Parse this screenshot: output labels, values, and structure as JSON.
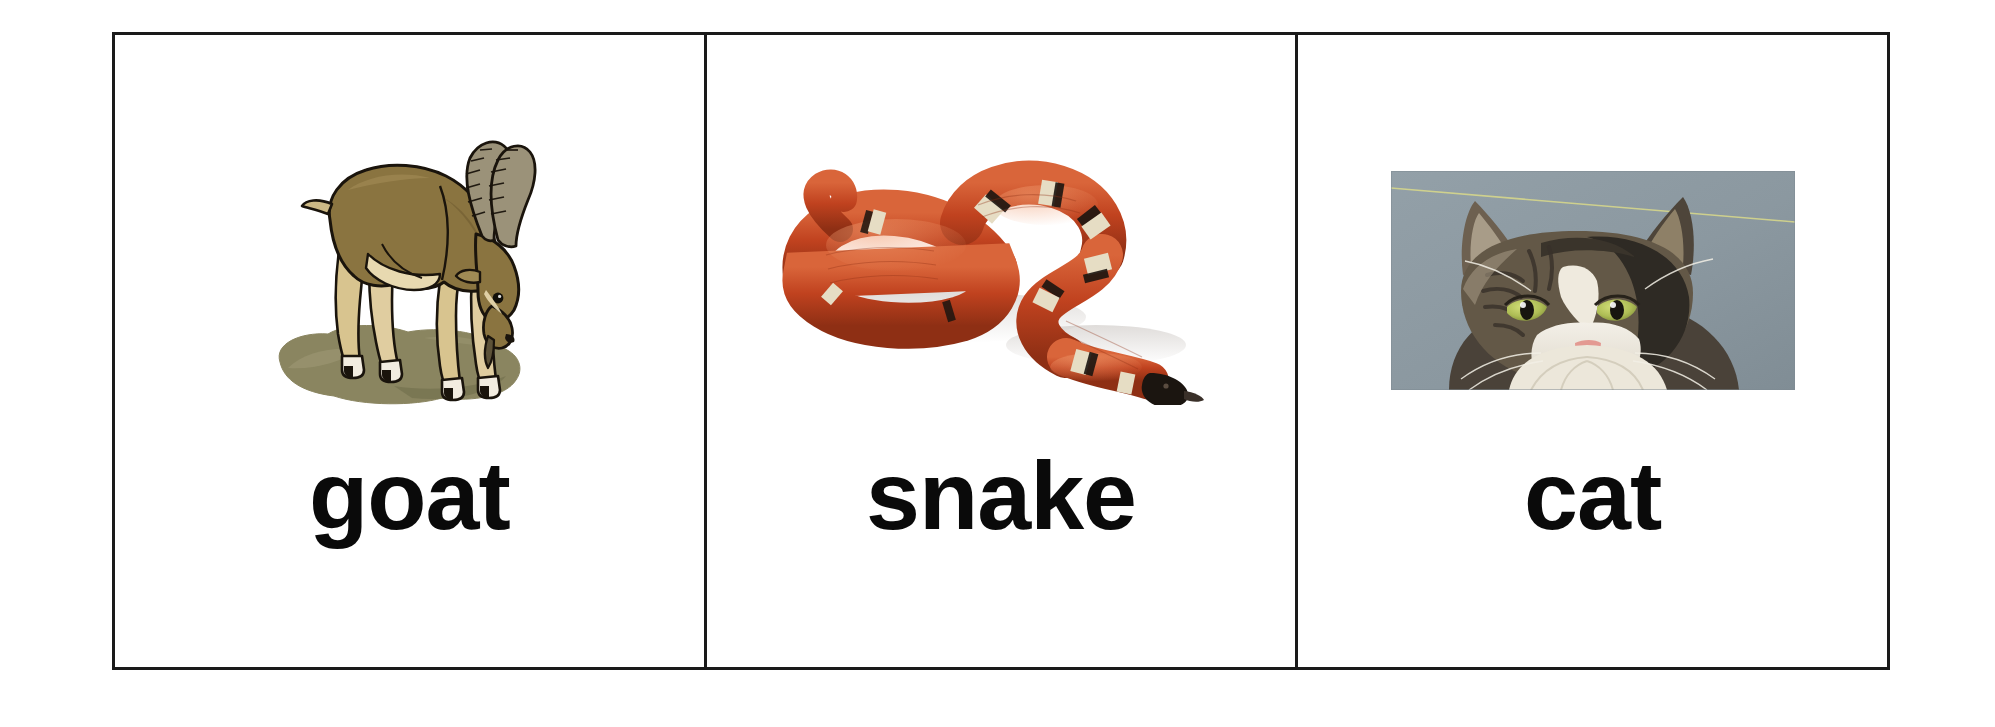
{
  "sheet": {
    "background_color": "#ffffff",
    "border_color": "#1a1a1a",
    "width": 1995,
    "height": 727
  },
  "cards": [
    {
      "id": "goat",
      "label": "goat",
      "art_name": "goat-illustration",
      "art_type": "line-art-illustration",
      "art_description": "Brown ibex-like goat with long curved ridged horns standing on a grey-olive rock, head lowered",
      "colors": {
        "body": "#8a7440",
        "body_shadow": "#6f5c31",
        "belly": "#e8d9b0",
        "leg_light": "#d8c48f",
        "horn": "#9b9279",
        "rock": "#8a8560",
        "rock_shadow": "#74704f",
        "outline": "#1a140c"
      }
    },
    {
      "id": "snake",
      "label": "snake",
      "art_name": "snake-photo",
      "art_type": "photograph",
      "art_description": "Coiled red-orange milk snake with black and cream bands and a black head, on white background",
      "colors": {
        "body": "#c0421f",
        "body_light": "#d9653a",
        "body_dark": "#8e2f14",
        "band_cream": "#e6ddc4",
        "band_black": "#1b1510",
        "background": "#ffffff"
      }
    },
    {
      "id": "cat",
      "label": "cat",
      "art_name": "cat-photo",
      "art_type": "photograph",
      "art_description": "Front-facing long-haired tabby-and-white cat with green eyes and pink nose against a grey-blue studio background, with a thin diagonal yellow line across the upper background",
      "colors": {
        "background": "#8d9aa2",
        "fur_dark": "#2e2a24",
        "fur_tabby": "#6d6050",
        "fur_white": "#f0ece4",
        "eye_green": "#b9c95a",
        "pupil": "#1a1a16",
        "nose_pink": "#e39a92",
        "line_yellow": "#d9d98a"
      }
    }
  ]
}
